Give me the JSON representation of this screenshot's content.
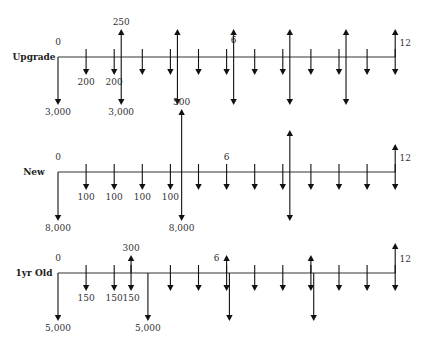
{
  "diagram": {
    "type": "cash-flow-diagram",
    "periods": 12,
    "rows": [
      {
        "name": "upgrade",
        "label": "Upgrade",
        "start_label": "0",
        "mid_label": "6",
        "end_label": "12",
        "flows": [
          {
            "period": 0,
            "dir": "down",
            "size": "long",
            "label": "3,000"
          },
          {
            "period": 1,
            "dir": "down",
            "size": "short",
            "label": "200"
          },
          {
            "period": 2,
            "dir": "down",
            "size": "short",
            "label": "200"
          },
          {
            "period": 2.25,
            "dir": "up",
            "size": "long",
            "label": "250"
          },
          {
            "period": 2.25,
            "dir": "down",
            "size": "long",
            "label": "3,000"
          },
          {
            "period": 3,
            "dir": "down",
            "size": "short",
            "label": ""
          },
          {
            "period": 4,
            "dir": "down",
            "size": "short",
            "label": ""
          },
          {
            "period": 4.25,
            "dir": "up",
            "size": "long",
            "label": ""
          },
          {
            "period": 4.25,
            "dir": "down",
            "size": "long",
            "label": ""
          },
          {
            "period": 5,
            "dir": "down",
            "size": "short",
            "label": ""
          },
          {
            "period": 6,
            "dir": "down",
            "size": "short",
            "label": ""
          },
          {
            "period": 6.25,
            "dir": "up",
            "size": "long",
            "label": ""
          },
          {
            "period": 6.25,
            "dir": "down",
            "size": "long",
            "label": ""
          },
          {
            "period": 7,
            "dir": "down",
            "size": "short",
            "label": ""
          },
          {
            "period": 8,
            "dir": "down",
            "size": "short",
            "label": ""
          },
          {
            "period": 8.25,
            "dir": "up",
            "size": "long",
            "label": ""
          },
          {
            "period": 8.25,
            "dir": "down",
            "size": "long",
            "label": ""
          },
          {
            "period": 9,
            "dir": "down",
            "size": "short",
            "label": ""
          },
          {
            "period": 10,
            "dir": "down",
            "size": "short",
            "label": ""
          },
          {
            "period": 10.25,
            "dir": "up",
            "size": "long",
            "label": ""
          },
          {
            "period": 10.25,
            "dir": "down",
            "size": "long",
            "label": ""
          },
          {
            "period": 11,
            "dir": "down",
            "size": "short",
            "label": ""
          },
          {
            "period": 12,
            "dir": "up",
            "size": "medium",
            "label": ""
          },
          {
            "period": 12,
            "dir": "down",
            "size": "short",
            "label": ""
          }
        ]
      },
      {
        "name": "new",
        "label": "New",
        "start_label": "0",
        "mid_label": "6",
        "end_label": "12",
        "flows": [
          {
            "period": 0,
            "dir": "down",
            "size": "long",
            "label": "8,000"
          },
          {
            "period": 1,
            "dir": "down",
            "size": "short",
            "label": "100"
          },
          {
            "period": 2,
            "dir": "down",
            "size": "short",
            "label": "100"
          },
          {
            "period": 3,
            "dir": "down",
            "size": "short",
            "label": "100"
          },
          {
            "period": 4,
            "dir": "down",
            "size": "short",
            "label": "100"
          },
          {
            "period": 4.4,
            "dir": "up",
            "size": "long",
            "label": "500"
          },
          {
            "period": 4.4,
            "dir": "down",
            "size": "long",
            "label": "8,000"
          },
          {
            "period": 5,
            "dir": "down",
            "size": "short",
            "label": ""
          },
          {
            "period": 6,
            "dir": "down",
            "size": "short",
            "label": ""
          },
          {
            "period": 7,
            "dir": "down",
            "size": "short",
            "label": ""
          },
          {
            "period": 8,
            "dir": "down",
            "size": "short",
            "label": ""
          },
          {
            "period": 8.25,
            "dir": "up",
            "size": "long",
            "label": ""
          },
          {
            "period": 8.25,
            "dir": "down",
            "size": "long",
            "label": ""
          },
          {
            "period": 9,
            "dir": "down",
            "size": "short",
            "label": ""
          },
          {
            "period": 10,
            "dir": "down",
            "size": "short",
            "label": ""
          },
          {
            "period": 11,
            "dir": "down",
            "size": "short",
            "label": ""
          },
          {
            "period": 12,
            "dir": "up",
            "size": "medium",
            "label": ""
          },
          {
            "period": 12,
            "dir": "down",
            "size": "short",
            "label": ""
          }
        ]
      },
      {
        "name": "1yr-old",
        "label": "1yr Old",
        "start_label": "0",
        "mid_label": "6",
        "end_label": "12",
        "flows": [
          {
            "period": 0,
            "dir": "down",
            "size": "long",
            "label": "5,000"
          },
          {
            "period": 1,
            "dir": "down",
            "size": "short",
            "label": "150"
          },
          {
            "period": 2,
            "dir": "down",
            "size": "short",
            "label": "150"
          },
          {
            "period": 2.6,
            "dir": "up",
            "size": "short-up",
            "label": "300"
          },
          {
            "period": 2.6,
            "dir": "down",
            "size": "short",
            "label": "150"
          },
          {
            "period": 3.2,
            "dir": "down",
            "size": "long",
            "label": "5,000"
          },
          {
            "period": 4,
            "dir": "down",
            "size": "short",
            "label": ""
          },
          {
            "period": 5,
            "dir": "down",
            "size": "short",
            "label": ""
          },
          {
            "period": 6,
            "dir": "up",
            "size": "short-up",
            "label": ""
          },
          {
            "period": 6,
            "dir": "down",
            "size": "short",
            "label": ""
          },
          {
            "period": 6.1,
            "dir": "down",
            "size": "long",
            "label": ""
          },
          {
            "period": 7,
            "dir": "down",
            "size": "short",
            "label": ""
          },
          {
            "period": 8,
            "dir": "down",
            "size": "short",
            "label": ""
          },
          {
            "period": 9,
            "dir": "up",
            "size": "short-up",
            "label": ""
          },
          {
            "period": 9,
            "dir": "down",
            "size": "short",
            "label": ""
          },
          {
            "period": 9.1,
            "dir": "down",
            "size": "long",
            "label": ""
          },
          {
            "period": 10,
            "dir": "down",
            "size": "short",
            "label": ""
          },
          {
            "period": 11,
            "dir": "down",
            "size": "short",
            "label": ""
          },
          {
            "period": 12,
            "dir": "up",
            "size": "medium",
            "label": ""
          },
          {
            "period": 12,
            "dir": "down",
            "size": "short",
            "label": ""
          }
        ]
      }
    ]
  }
}
